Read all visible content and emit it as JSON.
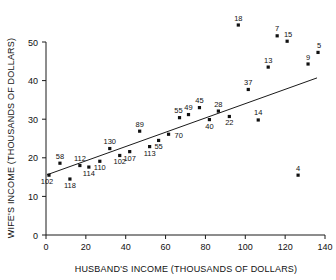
{
  "chart_data": {
    "type": "scatter",
    "title": "",
    "xlabel": "HUSBAND'S INCOME (THOUSANDS OF DOLLARS)",
    "ylabel": "WIFE'S INCOME (THOUSANDS OF DOLLARS)",
    "xlim": [
      0,
      140
    ],
    "ylim": [
      0,
      50
    ],
    "xticks": [
      0,
      20,
      40,
      60,
      80,
      100,
      120,
      140
    ],
    "yticks": [
      0,
      10,
      20,
      30,
      40,
      50
    ],
    "grid": false,
    "legend": null,
    "point_label_field": "case id",
    "fit_line": {
      "type": "linear regression",
      "x_start": 0.5,
      "y_start": 15.6,
      "x_end": 136.0,
      "y_end": 40.7
    },
    "points": [
      {
        "label": "102",
        "x": 1.5,
        "y": 15.5,
        "label_pos": "below-left"
      },
      {
        "label": "58",
        "x": 7.0,
        "y": 18.6,
        "label_pos": "above"
      },
      {
        "label": "118",
        "x": 12.0,
        "y": 14.5,
        "label_pos": "below"
      },
      {
        "label": "112",
        "x": 17.0,
        "y": 18.0,
        "label_pos": "above"
      },
      {
        "label": "114",
        "x": 21.5,
        "y": 17.6,
        "label_pos": "below"
      },
      {
        "label": "110",
        "x": 27.0,
        "y": 19.1,
        "label_pos": "below"
      },
      {
        "label": "130",
        "x": 32.0,
        "y": 22.4,
        "label_pos": "above"
      },
      {
        "label": "102b",
        "x": 37.0,
        "y": 20.6,
        "label_pos": "below",
        "display": "102"
      },
      {
        "label": "107",
        "x": 42.0,
        "y": 21.6,
        "label_pos": "below"
      },
      {
        "label": "89",
        "x": 47.0,
        "y": 26.9,
        "label_pos": "above"
      },
      {
        "label": "113",
        "x": 52.0,
        "y": 22.9,
        "label_pos": "below"
      },
      {
        "label": "55",
        "x": 56.5,
        "y": 24.5,
        "label_pos": "below"
      },
      {
        "label": "70",
        "x": 61.5,
        "y": 26.1,
        "label_pos": "below-right"
      },
      {
        "label": "55b",
        "x": 67.0,
        "y": 30.4,
        "label_pos": "above-left",
        "display": "55"
      },
      {
        "label": "49",
        "x": 71.5,
        "y": 31.2,
        "label_pos": "above"
      },
      {
        "label": "45",
        "x": 77.0,
        "y": 33.0,
        "label_pos": "above"
      },
      {
        "label": "40",
        "x": 82.0,
        "y": 29.9,
        "label_pos": "below"
      },
      {
        "label": "28",
        "x": 86.5,
        "y": 32.1,
        "label_pos": "above"
      },
      {
        "label": "22",
        "x": 92.0,
        "y": 30.7,
        "label_pos": "below"
      },
      {
        "label": "18",
        "x": 96.5,
        "y": 54.4,
        "label_pos": "above"
      },
      {
        "label": "37",
        "x": 101.5,
        "y": 37.7,
        "label_pos": "above"
      },
      {
        "label": "14",
        "x": 106.5,
        "y": 29.8,
        "label_pos": "above"
      },
      {
        "label": "13",
        "x": 111.5,
        "y": 43.5,
        "label_pos": "above"
      },
      {
        "label": "7",
        "x": 116.0,
        "y": 51.6,
        "label_pos": "above"
      },
      {
        "label": "15",
        "x": 121.0,
        "y": 50.2,
        "label_pos": "above-right"
      },
      {
        "label": "4",
        "x": 126.5,
        "y": 15.5,
        "label_pos": "above"
      },
      {
        "label": "9",
        "x": 131.5,
        "y": 44.3,
        "label_pos": "above"
      },
      {
        "label": "5",
        "x": 136.5,
        "y": 47.3,
        "label_pos": "above-right"
      }
    ]
  },
  "axes": {
    "x_title": "HUSBAND'S INCOME (THOUSANDS OF DOLLARS)",
    "y_title": "WIFE'S INCOME (THOUSANDS OF DOLLARS)"
  }
}
